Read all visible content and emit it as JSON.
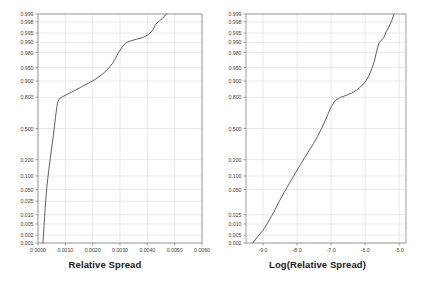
{
  "figure": {
    "background": "#ffffff",
    "grid_color": "#d9d9e3",
    "axis_color": "#888888",
    "curve_color": "#4d4d4d",
    "tick_label_color": "#3a3a3a",
    "title_color": "#1a1a1a"
  },
  "chart_data": [
    {
      "type": "line",
      "title": "",
      "xlabel": "Relative Spread",
      "ylabel": "",
      "grid": true,
      "legend": "none",
      "yscale": "normal-probability",
      "xlim": [
        0.0,
        0.006
      ],
      "ylim": [
        0.001,
        0.999
      ],
      "xticks": [
        "0.0000",
        "0.0010",
        "0.0020",
        "0.0030",
        "0.0040",
        "0.0050",
        "0.0060"
      ],
      "xtick_values": [
        0.0,
        0.001,
        0.002,
        0.003,
        0.004,
        0.005,
        0.006
      ],
      "yticks": [
        "0.999",
        "0.998",
        "0.995",
        "0.990",
        "0.980",
        "0.950",
        "0.900",
        "0.800",
        "0.500",
        "0.200",
        "0.100",
        "0.050",
        "0.025",
        "0.010",
        "0.005",
        "0.002",
        "0.001"
      ],
      "ytick_values": [
        0.999,
        0.998,
        0.995,
        0.99,
        0.98,
        0.95,
        0.9,
        0.8,
        0.5,
        0.2,
        0.1,
        0.05,
        0.025,
        0.01,
        0.005,
        0.002,
        0.001
      ],
      "series": [
        {
          "name": "Relative Spread CDF",
          "x": [
            0.00018,
            0.0002,
            0.00022,
            0.00024,
            0.00026,
            0.00029,
            0.00032,
            0.00036,
            0.0004,
            0.00045,
            0.0005,
            0.00056,
            0.0006,
            0.00064,
            0.00068,
            0.00072,
            0.00078,
            0.0009,
            0.0011,
            0.00135,
            0.0016,
            0.00185,
            0.0021,
            0.00235,
            0.00255,
            0.00272,
            0.00285,
            0.00295,
            0.00305,
            0.00315,
            0.00325,
            0.0034,
            0.0036,
            0.00385,
            0.00405,
            0.0042,
            0.0043,
            0.0044,
            0.00455,
            0.0047
          ],
          "y": [
            0.001,
            0.002,
            0.004,
            0.008,
            0.015,
            0.03,
            0.055,
            0.09,
            0.14,
            0.21,
            0.3,
            0.42,
            0.52,
            0.62,
            0.7,
            0.76,
            0.79,
            0.805,
            0.825,
            0.848,
            0.87,
            0.89,
            0.908,
            0.928,
            0.945,
            0.96,
            0.972,
            0.98,
            0.985,
            0.988,
            0.99,
            0.991,
            0.992,
            0.993,
            0.9945,
            0.996,
            0.9975,
            0.998,
            0.9985,
            0.999
          ]
        }
      ]
    },
    {
      "type": "line",
      "title": "",
      "xlabel": "Log(Relative Spread)",
      "ylabel": "",
      "grid": true,
      "legend": "none",
      "yscale": "normal-probability",
      "xlim": [
        -9.5,
        -4.8
      ],
      "ylim": [
        0.001,
        0.999
      ],
      "xticks": [
        "-9.0",
        "-8.0",
        "-7.0",
        "-6.0",
        "-5.0"
      ],
      "xtick_values": [
        -9.0,
        -8.0,
        -7.0,
        -6.0,
        -5.0
      ],
      "yticks": [
        "0.999",
        "0.998",
        "0.995",
        "0.990",
        "0.980",
        "0.950",
        "0.900",
        "0.800",
        "0.500",
        "0.200",
        "0.100",
        "0.050",
        "0.025",
        "0.010",
        "0.005",
        "0.002",
        "0.001"
      ],
      "ytick_values": [
        0.999,
        0.998,
        0.995,
        0.99,
        0.98,
        0.95,
        0.9,
        0.8,
        0.5,
        0.2,
        0.1,
        0.05,
        0.01,
        0.005,
        0.002,
        0.001
      ],
      "series": [
        {
          "name": "Log Relative Spread CDF",
          "x": [
            -9.3,
            -9.15,
            -9.0,
            -8.88,
            -8.78,
            -8.68,
            -8.6,
            -8.52,
            -8.45,
            -8.38,
            -8.3,
            -8.2,
            -8.1,
            -8.0,
            -7.9,
            -7.78,
            -7.65,
            -7.52,
            -7.4,
            -7.28,
            -7.18,
            -7.08,
            -7.0,
            -6.88,
            -6.72,
            -6.55,
            -6.4,
            -6.25,
            -6.1,
            -5.98,
            -5.88,
            -5.8,
            -5.73,
            -5.68,
            -5.63,
            -5.58,
            -5.52,
            -5.45,
            -5.38,
            -5.3,
            -5.22,
            -5.15
          ],
          "y": [
            0.001,
            0.0018,
            0.003,
            0.005,
            0.008,
            0.012,
            0.018,
            0.025,
            0.033,
            0.042,
            0.055,
            0.075,
            0.1,
            0.13,
            0.165,
            0.215,
            0.275,
            0.34,
            0.415,
            0.5,
            0.58,
            0.66,
            0.72,
            0.775,
            0.8,
            0.815,
            0.83,
            0.85,
            0.875,
            0.9,
            0.925,
            0.948,
            0.965,
            0.978,
            0.986,
            0.99,
            0.9915,
            0.993,
            0.9955,
            0.997,
            0.9982,
            0.999
          ]
        }
      ]
    }
  ],
  "panels": {
    "left": {
      "axis_title": "Relative Spread"
    },
    "right": {
      "axis_title": "Log(Relative Spread)"
    }
  }
}
